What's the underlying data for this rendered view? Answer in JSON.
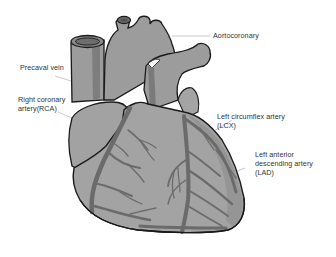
{
  "diagram": {
    "colors": {
      "background": "#ffffff",
      "muscle": "#9c9c9c",
      "muscle_light": "#a8a8a8",
      "artery": "#6b6b6b",
      "outline": "#1a1a1a",
      "leader_line": "#b0b0b0",
      "label_text": "#333333"
    },
    "labels": [
      {
        "id": "aortocoronary",
        "lines": [
          "Aortocoronary"
        ]
      },
      {
        "id": "precaval-vein",
        "lines": [
          "Precaval vein"
        ]
      },
      {
        "id": "rca",
        "lines": [
          "Right coronary",
          "artery(RCA)"
        ]
      },
      {
        "id": "lcx",
        "lines": [
          "Left circumflex artery",
          "(LCX)"
        ]
      },
      {
        "id": "lad",
        "lines": [
          "Left anterior",
          "descending artery",
          "(LAD)"
        ]
      }
    ]
  }
}
